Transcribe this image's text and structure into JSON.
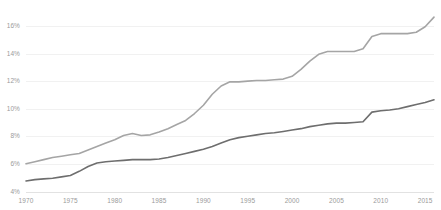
{
  "chart_data": {
    "type": "line",
    "title": "",
    "subtitle": "",
    "xlabel": "",
    "ylabel": "",
    "xlim": [
      1970,
      2016
    ],
    "ylim": [
      4,
      17
    ],
    "grid": true,
    "grid_axis": "y",
    "legend": "none",
    "y_ticks": [
      "4%",
      "6%",
      "8%",
      "10%",
      "12%",
      "14%",
      "16%"
    ],
    "y_tick_values": [
      4,
      6,
      8,
      10,
      12,
      14,
      16
    ],
    "x_ticks": [
      "1970",
      "1975",
      "1980",
      "1985",
      "1990",
      "1995",
      "2000",
      "2005",
      "2010",
      "2015"
    ],
    "x_tick_values": [
      1970,
      1975,
      1980,
      1985,
      1990,
      1995,
      2000,
      2005,
      2010,
      2015
    ],
    "x": [
      1970,
      1971,
      1972,
      1973,
      1974,
      1975,
      1976,
      1977,
      1978,
      1979,
      1980,
      1981,
      1982,
      1983,
      1984,
      1985,
      1986,
      1987,
      1988,
      1989,
      1990,
      1991,
      1992,
      1993,
      1994,
      1995,
      1996,
      1997,
      1998,
      1999,
      2000,
      2001,
      2002,
      2003,
      2004,
      2005,
      2006,
      2007,
      2008,
      2009,
      2010,
      2011,
      2012,
      2013,
      2014,
      2015,
      2016
    ],
    "series": [
      {
        "name": "upper-series",
        "color": "#a5a5a5",
        "width": 1.6,
        "values": [
          6.05,
          6.2,
          6.35,
          6.5,
          6.6,
          6.7,
          6.8,
          7.05,
          7.3,
          7.55,
          7.8,
          8.1,
          8.25,
          8.1,
          8.15,
          8.35,
          8.6,
          8.9,
          9.2,
          9.7,
          10.3,
          11.1,
          11.7,
          12.0,
          12.0,
          12.05,
          12.1,
          12.1,
          12.15,
          12.2,
          12.4,
          12.9,
          13.5,
          14.0,
          14.2,
          14.2,
          14.2,
          14.2,
          14.4,
          15.3,
          15.5,
          15.5,
          15.5,
          15.5,
          15.6,
          16.0,
          16.7
        ]
      },
      {
        "name": "lower-series",
        "color": "#6e6e6e",
        "width": 1.6,
        "values": [
          4.8,
          4.9,
          4.95,
          5.0,
          5.1,
          5.2,
          5.5,
          5.85,
          6.1,
          6.2,
          6.25,
          6.3,
          6.35,
          6.35,
          6.35,
          6.4,
          6.5,
          6.65,
          6.8,
          6.95,
          7.1,
          7.3,
          7.55,
          7.8,
          7.95,
          8.05,
          8.15,
          8.25,
          8.3,
          8.4,
          8.5,
          8.6,
          8.75,
          8.85,
          8.95,
          9.0,
          9.0,
          9.05,
          9.1,
          9.8,
          9.9,
          9.95,
          10.05,
          10.2,
          10.35,
          10.5,
          10.7
        ]
      }
    ]
  }
}
